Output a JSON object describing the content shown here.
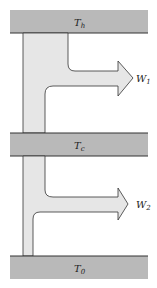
{
  "diagram": {
    "reservoirs": [
      {
        "id": "hot",
        "label": "T",
        "subscript": "h"
      },
      {
        "id": "cold-intermediate",
        "label": "T",
        "subscript": "c"
      },
      {
        "id": "ambient",
        "label": "T",
        "subscript": "0"
      }
    ],
    "work_outputs": [
      {
        "id": "w1",
        "label": "W",
        "subscript": "1"
      },
      {
        "id": "w2",
        "label": "W",
        "subscript": "2"
      }
    ],
    "colors": {
      "reservoir_fill": "#b9b9b9",
      "stream_fill": "#e6e6e6",
      "stroke": "#333333"
    }
  }
}
